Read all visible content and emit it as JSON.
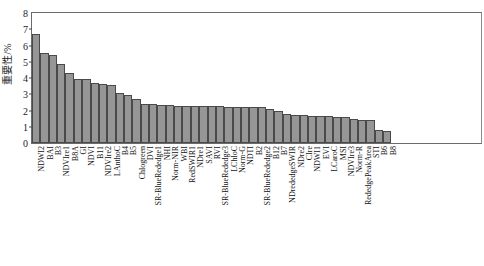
{
  "chart_data": {
    "type": "bar",
    "title": "",
    "xlabel": "",
    "ylabel": "重要性/%",
    "ylim": [
      0,
      8
    ],
    "yticks": [
      0,
      1,
      2,
      3,
      4,
      5,
      6,
      7,
      8
    ],
    "ytick_labels": [
      "0",
      "1",
      "2",
      "3",
      "4",
      "5",
      "6",
      "7",
      "8"
    ],
    "grid": false,
    "legend": null,
    "bar_color": "#969696",
    "bar_edge_color": "#4a4a4a",
    "categories": [
      "NDWI2",
      "BAI",
      "B3",
      "NDVIre1",
      "B8A",
      "GI",
      "NDVI",
      "B11",
      "NDVIre2",
      "LAnthoC",
      "B4",
      "B5",
      "Chlogreen",
      "DVI",
      "SR-BlueRededge1",
      "NHI",
      "Norm-NIR",
      "WBI",
      "RedSWIR1",
      "NDre1",
      "SAVI",
      "RVI",
      "SR-BlueRededge3",
      "LChloC",
      "Norm-G",
      "NDTI",
      "B2",
      "SR-BlueRededge2",
      "B12",
      "B7",
      "NDrededgeSWIR",
      "NDre2",
      "CIre",
      "NDWI1",
      "EVI",
      "LCaroC",
      "MSI",
      "NDVIre3",
      "Norm-R",
      "RededgePeakArea",
      "STI",
      "B6",
      "B8"
    ],
    "values": [
      6.7,
      5.55,
      5.4,
      4.85,
      4.33,
      3.97,
      3.92,
      3.68,
      3.66,
      3.6,
      3.1,
      2.95,
      2.72,
      2.4,
      2.38,
      2.33,
      2.31,
      2.3,
      2.29,
      2.28,
      2.27,
      2.26,
      2.25,
      2.24,
      2.23,
      2.22,
      2.21,
      2.2,
      2.1,
      1.95,
      1.78,
      1.72,
      1.7,
      1.68,
      1.66,
      1.65,
      1.63,
      1.62,
      1.45,
      1.42,
      1.4,
      0.8,
      0.75
    ]
  }
}
